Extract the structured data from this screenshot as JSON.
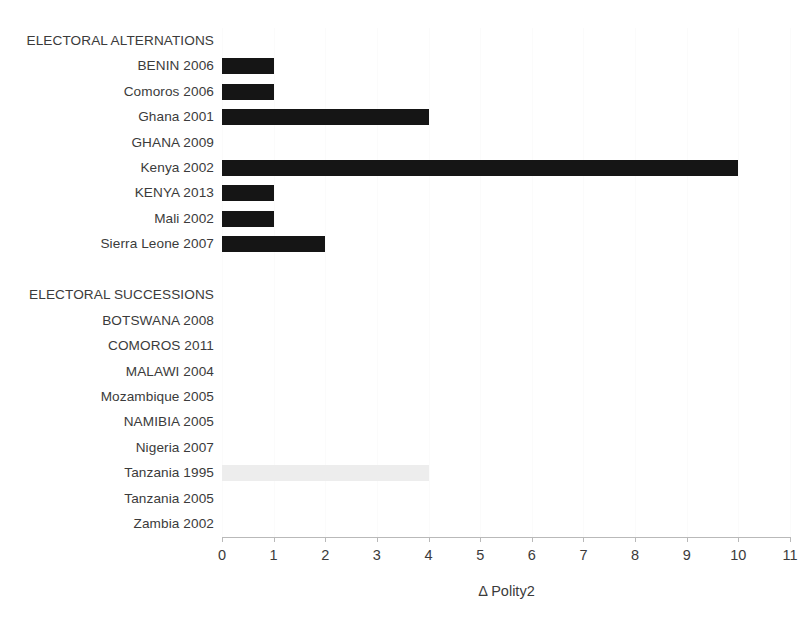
{
  "chart_data": {
    "type": "bar",
    "orientation": "horizontal",
    "title": "",
    "subtitle": "",
    "xlabel": "Δ Polity2",
    "ylabel": "",
    "xlim": [
      0,
      11
    ],
    "xticks": [
      0,
      1,
      2,
      3,
      4,
      5,
      6,
      7,
      8,
      9,
      10,
      11
    ],
    "xtick_labels": [
      "0",
      "1",
      "2",
      "3",
      "4",
      "5",
      "6",
      "7",
      "8",
      "9",
      "10",
      "11"
    ],
    "grid": true,
    "grid_axis": "x",
    "legend": false,
    "legend_position": "none",
    "categories": [
      "ELECTORAL ALTERNATIONS",
      "BENIN 2006",
      "Comoros 2006",
      "Ghana 2001",
      "GHANA 2009",
      "Kenya 2002",
      "KENYA 2013",
      "Mali 2002",
      "Sierra Leone 2007",
      "",
      "ELECTORAL SUCCESSIONS",
      "BOTSWANA 2008",
      "COMOROS 2011",
      "MALAWI 2004",
      "Mozambique 2005",
      "NAMIBIA 2005",
      "Nigeria 2007",
      "Tanzania 1995",
      "Tanzania 2005",
      "Zambia 2002"
    ],
    "values": [
      0,
      1,
      1,
      4,
      0,
      10,
      1,
      1,
      2,
      0,
      0,
      0,
      0,
      0,
      0,
      0,
      0,
      4,
      0,
      0
    ],
    "bar_colors": [
      "none",
      "#151515",
      "#151515",
      "#151515",
      "none",
      "#151515",
      "#151515",
      "#151515",
      "#151515",
      "none",
      "none",
      "none",
      "none",
      "none",
      "none",
      "none",
      "none",
      "#ededed",
      "none",
      "none"
    ],
    "groups": [
      {
        "header": "ELECTORAL ALTERNATIONS",
        "members": [
          {
            "label": "BENIN 2006",
            "value": 1
          },
          {
            "label": "Comoros 2006",
            "value": 1
          },
          {
            "label": "Ghana 2001",
            "value": 4
          },
          {
            "label": "GHANA 2009",
            "value": 0
          },
          {
            "label": "Kenya 2002",
            "value": 10
          },
          {
            "label": "KENYA 2013",
            "value": 1
          },
          {
            "label": "Mali 2002",
            "value": 1
          },
          {
            "label": "Sierra Leone 2007",
            "value": 2
          }
        ]
      },
      {
        "header": "ELECTORAL SUCCESSIONS",
        "members": [
          {
            "label": "BOTSWANA 2008",
            "value": 0
          },
          {
            "label": "COMOROS 2011",
            "value": 0
          },
          {
            "label": "MALAWI 2004",
            "value": 0
          },
          {
            "label": "Mozambique 2005",
            "value": 0
          },
          {
            "label": "NAMIBIA 2005",
            "value": 0
          },
          {
            "label": "Nigeria 2007",
            "value": 0
          },
          {
            "label": "Tanzania 1995",
            "value": 4
          },
          {
            "label": "Tanzania 2005",
            "value": 0
          },
          {
            "label": "Zambia 2002",
            "value": 0
          }
        ]
      }
    ],
    "colors": {
      "bar_dark": "#151515",
      "bar_light": "#ededed",
      "axis": "#b9b9b9",
      "grid": "#fbfbfb",
      "text": "#3b3b3b",
      "background": "#ffffff"
    }
  }
}
